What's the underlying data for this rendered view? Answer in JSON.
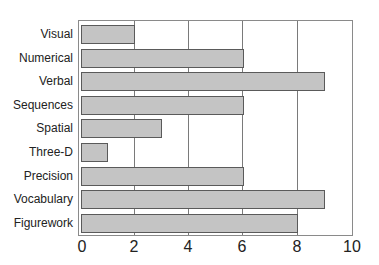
{
  "chart_data": {
    "type": "bar",
    "orientation": "horizontal",
    "title": "",
    "xlabel": "",
    "ylabel": "",
    "categories": [
      "Visual",
      "Numerical",
      "Verbal",
      "Sequences",
      "Spatial",
      "Three-D",
      "Precision",
      "Vocabulary",
      "Figurework"
    ],
    "values": [
      2,
      6,
      9,
      6,
      3,
      1,
      6,
      9,
      8
    ],
    "xlim": [
      0,
      10
    ],
    "xticks": [
      "0",
      "2",
      "4",
      "6",
      "8",
      "10"
    ],
    "grid": "vertical",
    "legend": null,
    "bar_color": "#c4c4c4",
    "bar_edge_color": "#5a5a5a"
  }
}
